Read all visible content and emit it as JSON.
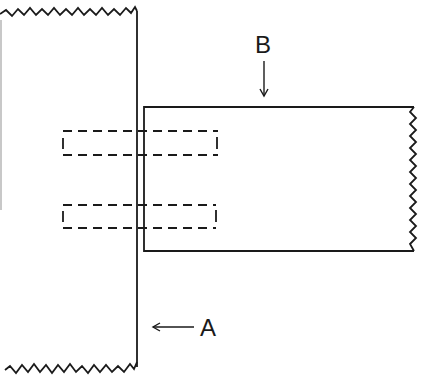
{
  "diagram": {
    "type": "joint-detail",
    "colors": {
      "line": "#1a1a1a",
      "background": "#ffffff"
    },
    "members": [
      {
        "id": "A",
        "label": "A",
        "orientation": "vertical",
        "edges": {
          "top": "broken-zigzag",
          "bottom": "broken-zigzag",
          "right": "straight"
        }
      },
      {
        "id": "B",
        "label": "B",
        "orientation": "horizontal",
        "edges": {
          "left": "straight",
          "top": "straight",
          "bottom": "straight",
          "right": "broken-zigzag"
        }
      }
    ],
    "dowels": [
      {
        "id": "dowel-upper",
        "style": "hidden-dashed"
      },
      {
        "id": "dowel-lower",
        "style": "hidden-dashed"
      }
    ],
    "callouts": [
      {
        "label": "B",
        "arrow": "down",
        "points_to": "member B top edge"
      },
      {
        "label": "A",
        "arrow": "left",
        "points_to": "member A right edge"
      }
    ]
  }
}
